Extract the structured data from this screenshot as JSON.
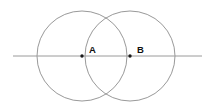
{
  "canvas": {
    "width": 214,
    "height": 108,
    "background_color": "#ffffff"
  },
  "diagram": {
    "stroke_color": "#8d8d8d",
    "line_color": "#9a9a9a",
    "point_color": "#1a1a1a",
    "label_color": "#111111",
    "circles": [
      {
        "name": "circle-a",
        "center_label": "A",
        "cx": 82,
        "cy": 56,
        "r": 45
      },
      {
        "name": "circle-b",
        "center_label": "B",
        "cx": 130,
        "cy": 56,
        "r": 45
      }
    ],
    "line": {
      "name": "horizontal-line",
      "x1": 13,
      "y1": 56,
      "x2": 202,
      "y2": 56
    },
    "points": [
      {
        "name": "point-a",
        "label": "A",
        "cx": 82,
        "cy": 56,
        "r": 1.7,
        "label_x": 89,
        "label_y": 53
      },
      {
        "name": "point-b",
        "label": "B",
        "cx": 130,
        "cy": 56,
        "r": 1.7,
        "label_x": 137,
        "label_y": 53
      }
    ],
    "intersections": [
      {
        "name": "intersection-top",
        "x": 106,
        "y": 13
      },
      {
        "name": "intersection-bottom",
        "x": 106,
        "y": 95
      }
    ]
  }
}
